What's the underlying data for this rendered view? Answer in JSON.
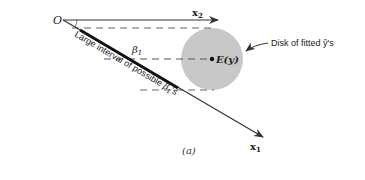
{
  "diagram": {
    "origin_label": "O",
    "x1_label": "x",
    "x1_subscript": "1",
    "x2_label": "x",
    "x2_subscript": "2",
    "beta_label": "β",
    "beta_subscript": "1",
    "center_label": "E(y)",
    "disk_label": "Disk of fitted ŷ's",
    "interval_label_prefix": "Large interval of possible ",
    "interval_label_beta": "β̂",
    "interval_label_sub": "1",
    "interval_label_suffix": "'s",
    "caption": "(a)",
    "colors": {
      "disk": "#c8c8c8",
      "line": "#222222",
      "dashed": "#666666",
      "text": "#222222"
    }
  }
}
